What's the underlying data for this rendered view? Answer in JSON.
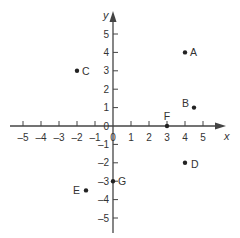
{
  "chart_data": {
    "type": "scatter",
    "title": "",
    "xlabel": "x",
    "ylabel": "y",
    "xlim": [
      -5,
      5
    ],
    "ylim": [
      -5,
      5
    ],
    "x_ticks": [
      -5,
      -4,
      -3,
      -2,
      -1,
      0,
      1,
      2,
      3,
      4,
      5
    ],
    "y_ticks": [
      -5,
      -4,
      -3,
      -2,
      -1,
      1,
      2,
      3,
      4,
      5
    ],
    "grid": false,
    "points": [
      {
        "label": "A",
        "x": 4,
        "y": 4
      },
      {
        "label": "B",
        "x": 4.5,
        "y": 1
      },
      {
        "label": "C",
        "x": -2,
        "y": 3
      },
      {
        "label": "D",
        "x": 4,
        "y": -2
      },
      {
        "label": "E",
        "x": -1.5,
        "y": -3.5
      },
      {
        "label": "F",
        "x": 3,
        "y": 0
      },
      {
        "label": "G",
        "x": 0,
        "y": -3
      }
    ]
  },
  "colors": {
    "axis": "#444444",
    "point": "#222222",
    "text": "#333333"
  }
}
